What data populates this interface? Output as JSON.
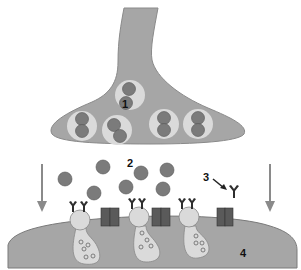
{
  "diagram": {
    "labels": {
      "presynaptic_vesicle": "1",
      "neurotransmitter": "2",
      "receptor": "3",
      "postsynaptic": "4"
    },
    "colors": {
      "membrane": "#a6a6a6",
      "membrane_edge": "#7a7a7a",
      "vesicle": "#dadada",
      "neurotransmitter": "#7b7b7b",
      "channel": "#5a5a5a",
      "receptor": "#2e2e2e",
      "arrow": "#8a8a8a"
    }
  }
}
